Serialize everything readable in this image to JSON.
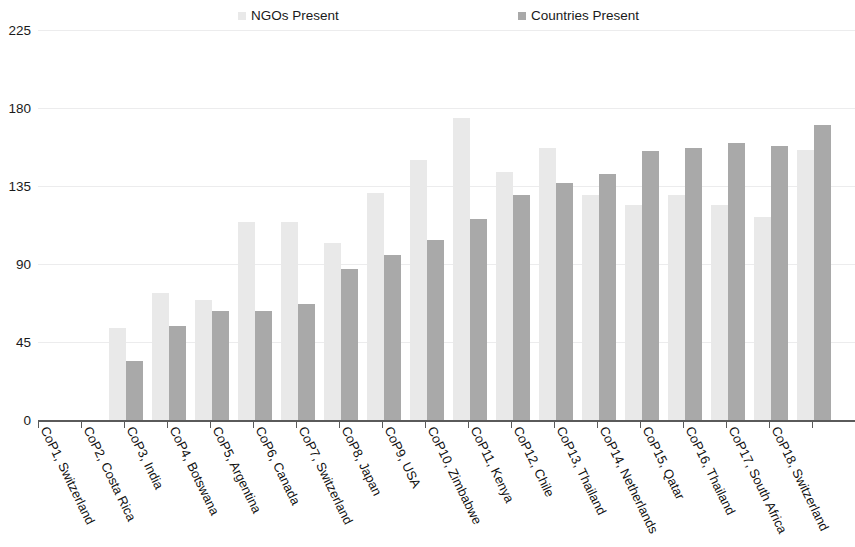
{
  "legend": {
    "position": "top",
    "entries": [
      {
        "label": "NGOs Present",
        "color": "#e9e9e9"
      },
      {
        "label": "Countries Present",
        "color": "#a9a9a9"
      }
    ]
  },
  "axis": {
    "y_ticks": [
      "0",
      "45",
      "90",
      "135",
      "180",
      "225"
    ],
    "y_min": 0,
    "y_max": 225
  },
  "chart_data": {
    "type": "bar",
    "title": "",
    "subtitle": "",
    "xlabel": "",
    "ylabel": "",
    "ylim": [
      0,
      225
    ],
    "yticks": [
      0,
      45,
      90,
      135,
      180,
      225
    ],
    "grid": true,
    "legend_position": "top",
    "categories": [
      "CoP1, Switzerland",
      "CoP2, Costa Rica",
      "CoP3, India",
      "CoP4, Botswana",
      "CoP5, Argentina",
      "CoP6, Canada",
      "CoP7, Switzerland",
      "CoP8, Japan",
      "CoP9, USA",
      "CoP10, Zimbabwe",
      "CoP11, Kenya",
      "CoP12, Chile",
      "CoP13, Thailand",
      "CoP14, Netherlands",
      "CoP15, Qatar",
      "CoP16, Thailand",
      "CoP17, South Africa",
      "CoP18, Switzerland"
    ],
    "series": [
      {
        "name": "NGOs Present",
        "color": "#e9e9e9",
        "values": [
          0,
          53,
          73,
          69,
          114,
          114,
          102,
          131,
          150,
          174,
          143,
          157,
          130,
          124,
          130,
          124,
          117,
          156
        ]
      },
      {
        "name": "Countries Present",
        "color": "#a9a9a9",
        "values": [
          0,
          34,
          54,
          63,
          63,
          67,
          87,
          95,
          104,
          116,
          130,
          137,
          142,
          155,
          157,
          160,
          158,
          170
        ]
      }
    ]
  }
}
